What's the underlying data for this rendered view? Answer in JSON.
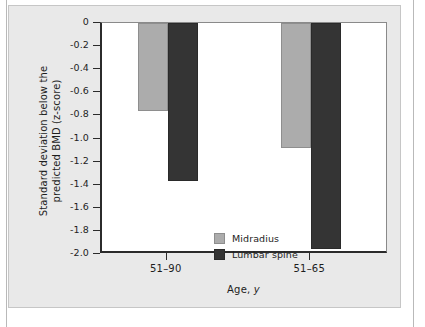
{
  "figure": {
    "panel_background": "#e9e9e9",
    "plot_background": "#ffffff",
    "axis_color": "#2b2b2b"
  },
  "chart_data": {
    "type": "bar",
    "title": "",
    "subtitle": "",
    "xlabel": "Age, y",
    "ylabel": "Standard deviation below the predicted BMD (z-score)",
    "ylabel_line1": "Standard deviation below the",
    "ylabel_line2": "predicted BMD (z-score)",
    "categories": [
      "51–90",
      "51–65"
    ],
    "series": [
      {
        "name": "Midradius",
        "color": "#acacac",
        "values": [
          -0.76,
          -1.08
        ]
      },
      {
        "name": "Lumbar spine",
        "color": "#343434",
        "values": [
          -1.37,
          -1.96
        ]
      }
    ],
    "ylim": [
      -2.0,
      0
    ],
    "ytick_values": [
      0,
      -0.2,
      -0.4,
      -0.6,
      -0.8,
      -1.0,
      -1.2,
      -1.4,
      -1.6,
      -1.8,
      -2.0
    ],
    "ytick_labels": [
      "0",
      "-0.2",
      "-0.4",
      "-0.6",
      "-0.8",
      "-1.0",
      "-1.2",
      "-1.4",
      "-1.6",
      "-1.8",
      "-2.0"
    ],
    "xtick_labels": [
      "51–90",
      "51–65"
    ],
    "grid": false,
    "legend_position": "inside-lower-left",
    "legend_entries": [
      "Midradius",
      "Lumbar spine"
    ],
    "bar_direction": "downward-from-zero"
  }
}
